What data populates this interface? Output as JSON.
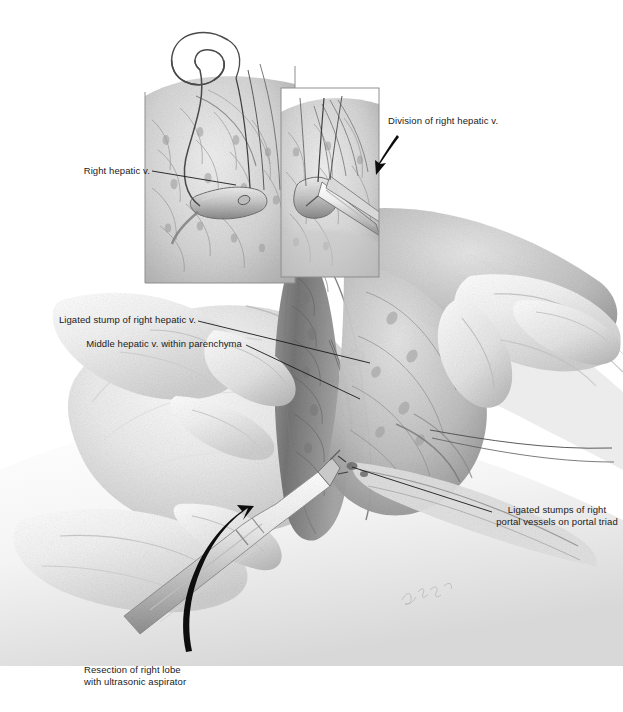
{
  "figure": {
    "kind": "medical-surgical-illustration",
    "medium": "graphite pencil drawing, grayscale",
    "width": 623,
    "height": 712,
    "background_color": "#ffffff",
    "ink_color": "#1a1a1a",
    "signature": "artist signature in light pencil, lower right of main scene"
  },
  "labels": {
    "right_hepatic_v": "Right hepatic v.",
    "division_of_right_hepatic_v": "Division of right hepatic v.",
    "ligated_stump_right_hepatic_v": "Ligated stump of right hepatic v.",
    "middle_hepatic_v": "Middle hepatic v. within parenchyma",
    "ligated_stumps_portal": "Ligated stumps of\nright portal vessels\non portal triad",
    "resection_caption": "Resection of right lobe\nwith ultrasonic aspirator"
  },
  "panels": [
    {
      "name": "inset-left",
      "caption_ref": "right_hepatic_v",
      "content": "Right hepatic vein encircled by suture ligature within liver parenchyma",
      "frame": {
        "x": 145,
        "y": 60,
        "width": 150,
        "height": 223
      }
    },
    {
      "name": "inset-right",
      "caption_ref": "division_of_right_hepatic_v",
      "content": "Scissors dividing the ligated right hepatic vein",
      "frame": {
        "x": 281,
        "y": 88,
        "width": 98,
        "height": 189
      }
    },
    {
      "name": "main-scene",
      "content": "Surgeon's hands retracting liver; ultrasonic aspirator transecting parenchyma along the principal plane",
      "frame": {
        "x": 40,
        "y": 200,
        "width": 560,
        "height": 420
      }
    }
  ],
  "arrows": [
    {
      "name": "arrow-to-division-inset",
      "from": [
        396,
        140
      ],
      "to": [
        378,
        167
      ],
      "style": "curved-tapered"
    },
    {
      "name": "arrow-to-resection",
      "from": [
        193,
        648
      ],
      "to": [
        243,
        517
      ],
      "style": "curved-tapered"
    }
  ],
  "leader_lines": [
    {
      "name": "leader-right-hepatic-v",
      "from": [
        152,
        172
      ],
      "to": [
        232,
        184
      ]
    },
    {
      "name": "leader-ligated-stump",
      "from": [
        198,
        321
      ],
      "to": [
        368,
        364
      ]
    },
    {
      "name": "leader-middle-hepatic-v",
      "from": [
        244,
        344
      ],
      "to": [
        358,
        398
      ]
    },
    {
      "name": "leader-portal-stumps",
      "from": [
        492,
        512
      ],
      "to": [
        352,
        467
      ]
    }
  ]
}
